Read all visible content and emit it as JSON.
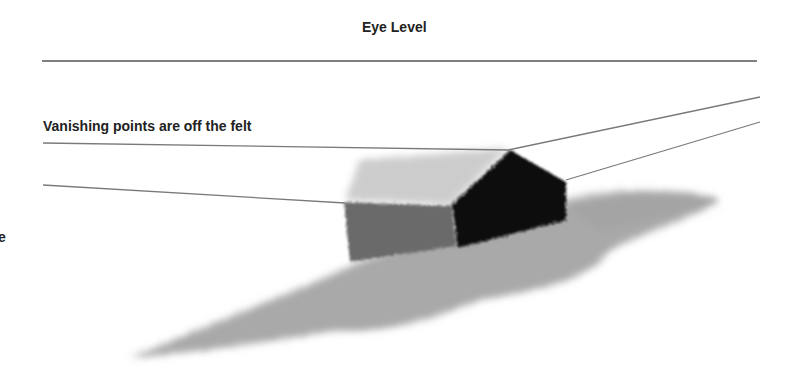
{
  "labels": {
    "eye_level": "Eye Level",
    "vanishing_points": "Vanishing points are off the felt",
    "edge_fragment": "e"
  },
  "colors": {
    "line": "#7a7a7a",
    "eye_level_line": "#555555",
    "text": "#222222",
    "dark_face": "#0a0a0a",
    "roof": "#c8c8c8",
    "side_face": "#6e6e6e",
    "ground_wisp": "#8c8c8c"
  }
}
